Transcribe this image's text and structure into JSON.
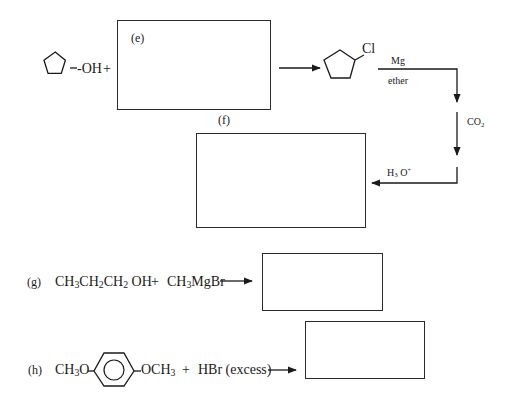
{
  "diagram": {
    "type": "reaction-scheme",
    "reactions": {
      "ef": {
        "reactant": {
          "ring": "cyclopentane",
          "group": "-OH"
        },
        "plus": "+",
        "box_e_label": "(e)",
        "product": {
          "ring": "cyclopentane",
          "group": "Cl"
        },
        "step1": {
          "above": "Mg",
          "below": "ether"
        },
        "step2": {
          "reagent": "CO",
          "sub": "2"
        },
        "step3": {
          "reagent": "H",
          "sub": "3",
          "after": " O",
          "sup": "+"
        },
        "box_f_label": "(f)"
      },
      "g": {
        "label": "(g)",
        "reactant1": [
          {
            "t": "CH"
          },
          {
            "s": "3"
          },
          {
            "t": "CH"
          },
          {
            "s": "2"
          },
          {
            "t": "CH"
          },
          {
            "s": "2"
          },
          {
            "t": " OH"
          }
        ],
        "plus": "+",
        "reactant2_a": "CH",
        "reactant2_sub": "3",
        "reactant2_b": "MgBr"
      },
      "h": {
        "label": "(h)",
        "left_group_a": "CH",
        "left_group_sub": "3",
        "left_group_b": "O",
        "right_group_a": "OCH",
        "right_group_sub": "3",
        "plus": "+",
        "reagent": "HBr (excess)"
      }
    }
  }
}
